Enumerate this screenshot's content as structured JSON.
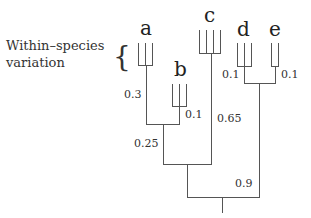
{
  "diagram": {
    "type": "phylogenetic-tree",
    "annotation": {
      "line1": "Within–species",
      "line2": "variation",
      "brace": "{"
    },
    "taxa": [
      {
        "label": "a",
        "individuals": 3
      },
      {
        "label": "b",
        "individuals": 3
      },
      {
        "label": "c",
        "individuals": 4
      },
      {
        "label": "d",
        "individuals": 3
      },
      {
        "label": "e",
        "individuals": 2
      }
    ],
    "branch_lengths": {
      "a": "0.3",
      "b": "0.1",
      "ab": "0.25",
      "c": "0.65",
      "d": "0.1",
      "e": "0.1",
      "de": "0.9"
    },
    "topology": "(((a:0.3,b:0.1):0.25,c:0.65),(d:0.1,e:0.1):0.9)"
  }
}
